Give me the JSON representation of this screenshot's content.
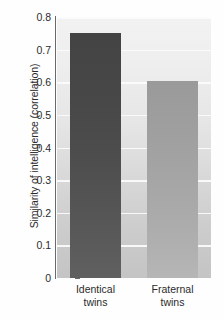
{
  "chart_data": {
    "type": "bar",
    "title": "",
    "xlabel": "",
    "ylabel": "Similarity of intelligence (correlation)",
    "categories": [
      "Identical twins",
      "Fraternal twins"
    ],
    "category_lines": [
      [
        "Identical",
        "twins"
      ],
      [
        "Fraternal",
        "twins"
      ]
    ],
    "values": [
      0.75,
      0.605
    ],
    "ylim": [
      0,
      0.8
    ],
    "yticks": [
      0,
      0.1,
      0.2,
      0.3,
      0.4,
      0.5,
      0.6,
      0.7,
      0.8
    ],
    "ytick_labels": [
      "0",
      "0.1",
      "0.2",
      "0.3",
      "0.4",
      "0.5",
      "0.6",
      "0.7",
      "0.8"
    ],
    "grid": true,
    "legend": "none",
    "bar_colors": [
      "#4d4d4d",
      "#a8a8a8"
    ],
    "gridline_color": "#fcfcfc",
    "axis_color": "#6a6a6a",
    "text_color": "#2b2b2b",
    "plot_background": "#e3e3e3"
  }
}
